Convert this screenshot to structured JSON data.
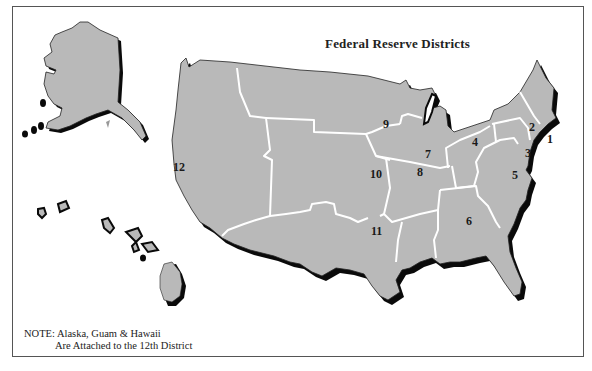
{
  "title": "Federal Reserve Districts",
  "note": {
    "line1": "NOTE: Alaska, Guam & Hawaii",
    "line2": "Are Attached to the 12th District"
  },
  "colors": {
    "land": "#b9b9b9",
    "shadow": "#0a0a0a",
    "boundary": "#ffffff",
    "frame": "#555555"
  },
  "districts": [
    {
      "id": "1",
      "label": "1"
    },
    {
      "id": "2",
      "label": "2"
    },
    {
      "id": "3",
      "label": "3"
    },
    {
      "id": "4",
      "label": "4"
    },
    {
      "id": "5",
      "label": "5"
    },
    {
      "id": "6",
      "label": "6"
    },
    {
      "id": "7",
      "label": "7"
    },
    {
      "id": "8",
      "label": "8"
    },
    {
      "id": "9",
      "label": "9"
    },
    {
      "id": "10",
      "label": "10"
    },
    {
      "id": "11",
      "label": "11"
    },
    {
      "id": "12",
      "label": "12"
    }
  ],
  "insets": [
    "Alaska",
    "Hawaii"
  ]
}
